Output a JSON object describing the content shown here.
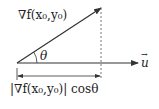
{
  "diagram": {
    "colors": {
      "stroke": "#333333",
      "text": "#222222",
      "background": "#ffffff"
    },
    "gradient_vector": {
      "label": "∇f(x₀,y₀)"
    },
    "direction_vector": {
      "label": "u",
      "accent": "→"
    },
    "angle": {
      "label": "θ"
    },
    "projection": {
      "label": "|∇f(x₀,y₀)| cosθ"
    }
  }
}
